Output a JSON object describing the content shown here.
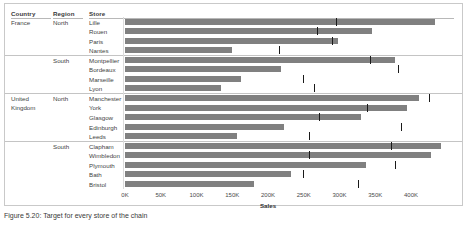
{
  "table": {
    "headers": [
      "Country",
      "Region",
      "Store"
    ],
    "country_labels": [
      {
        "text": "France",
        "row": 0
      },
      {
        "text": "United",
        "row": 8
      },
      {
        "text": "Kingdom",
        "row": 9
      }
    ],
    "region_labels": [
      {
        "text": "North",
        "row": 0
      },
      {
        "text": "South",
        "row": 4
      },
      {
        "text": "North",
        "row": 8
      },
      {
        "text": "South",
        "row": 13
      }
    ]
  },
  "axis": {
    "title": "Sales",
    "ticks": [
      "0K",
      "50K",
      "100K",
      "150K",
      "200K",
      "250K",
      "300K",
      "350K",
      "400K"
    ],
    "tick_values": [
      0,
      50000,
      100000,
      150000,
      200000,
      250000,
      300000,
      350000,
      400000
    ],
    "min": 0,
    "max": 425000
  },
  "caption": "Figure 5.20: Target for every store of the chain",
  "colors": {
    "bar": "#808080",
    "marker": "#1a1a1a",
    "border": "#c9c9c9",
    "separator": "#c4c4c4"
  },
  "chart_data": {
    "type": "bar",
    "title": "",
    "xlabel": "Sales",
    "ylabel": "",
    "xlim": [
      0,
      425000
    ],
    "grid": false,
    "legend": "none",
    "orientation": "horizontal",
    "categories": [
      "Lille",
      "Rouen",
      "Paris",
      "Nantes",
      "Montpellier",
      "Bordeaux",
      "Marseille",
      "Lyon",
      "Manchester",
      "York",
      "Glasgow",
      "Edinburgh",
      "Leeds",
      "Clapham",
      "Wimbledon",
      "Plymouth",
      "Bath",
      "Bristol"
    ],
    "series": [
      {
        "name": "Sales",
        "values": [
          434000,
          346000,
          298000,
          150000,
          378000,
          218000,
          162000,
          134000,
          411000,
          394000,
          330000,
          222000,
          157000,
          442000,
          428000,
          337000,
          232000,
          180000
        ]
      },
      {
        "name": "Target",
        "type": "reference-marker",
        "values": [
          295000,
          268000,
          289000,
          216000,
          342000,
          382000,
          249000,
          265000,
          425000,
          338000,
          272000,
          386000,
          258000,
          372000,
          258000,
          378000,
          249000,
          326000
        ]
      }
    ],
    "groups": [
      {
        "country": "France",
        "region": "North",
        "stores": [
          "Lille",
          "Rouen",
          "Paris",
          "Nantes"
        ]
      },
      {
        "country": "France",
        "region": "South",
        "stores": [
          "Montpellier",
          "Bordeaux",
          "Marseille",
          "Lyon"
        ]
      },
      {
        "country": "United Kingdom",
        "region": "North",
        "stores": [
          "Manchester",
          "York",
          "Glasgow",
          "Edinburgh",
          "Leeds"
        ]
      },
      {
        "country": "United Kingdom",
        "region": "South",
        "stores": [
          "Clapham",
          "Wimbledon",
          "Plymouth",
          "Bath",
          "Bristol"
        ]
      }
    ],
    "group_breaks_after": [
      3,
      7,
      12
    ]
  }
}
